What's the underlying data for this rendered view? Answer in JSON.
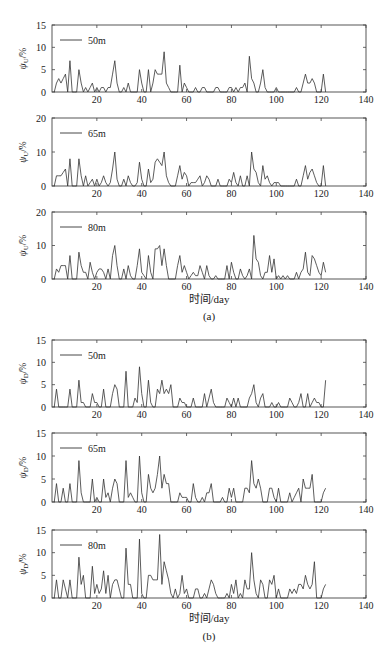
{
  "figure": {
    "caption_a": "(a)",
    "caption_b": "(b)",
    "xlabel": "时间/day"
  },
  "chart_data": [
    {
      "type": "line",
      "group": "a",
      "legend": "50m",
      "ylabel": "ψU/%",
      "ylim": [
        0,
        15
      ],
      "yticks": [
        0,
        5,
        10,
        15
      ],
      "xlim": [
        0,
        140
      ],
      "xticks": [
        20,
        40,
        60,
        80,
        100,
        120,
        140
      ],
      "x_start": 1,
      "values": [
        0,
        2,
        3,
        2,
        3,
        4,
        0,
        7,
        0,
        0,
        0,
        5,
        2,
        0,
        1,
        0,
        1,
        2,
        0,
        1,
        0,
        1,
        1,
        0,
        1,
        1,
        4,
        7,
        2,
        0,
        0,
        1,
        0,
        2,
        0,
        0,
        0,
        0,
        5,
        2,
        0,
        0,
        5,
        0,
        2,
        5,
        4,
        4,
        4,
        9,
        2,
        1,
        0,
        0,
        0,
        0,
        6,
        0,
        2,
        1,
        0,
        0,
        0,
        1,
        0,
        0,
        1,
        1,
        0,
        0,
        0,
        0,
        1,
        1,
        0,
        0,
        0,
        0,
        1,
        1,
        0,
        1,
        0,
        1,
        1,
        2,
        0,
        8,
        3,
        2,
        0,
        0,
        2,
        5,
        1,
        0,
        0,
        0,
        0,
        1,
        0,
        0,
        0,
        0,
        0,
        0,
        0,
        0,
        1,
        0,
        0,
        2,
        4,
        2,
        2,
        3,
        2,
        0,
        0,
        0,
        4,
        0
      ],
      "line_color": "#333333"
    },
    {
      "type": "line",
      "group": "a",
      "legend": "65m",
      "ylabel": "ψU/%",
      "ylim": [
        0,
        20
      ],
      "yticks": [
        0,
        10,
        20
      ],
      "xlim": [
        0,
        140
      ],
      "xticks": [
        20,
        40,
        60,
        80,
        100,
        120,
        140
      ],
      "x_start": 1,
      "values": [
        0,
        3,
        3,
        3,
        4,
        5,
        0,
        8,
        0,
        0,
        0,
        8,
        3,
        0,
        3,
        0,
        1,
        2,
        0,
        2,
        0,
        1,
        3,
        1,
        0,
        1,
        5,
        10,
        2,
        0,
        0,
        2,
        0,
        3,
        1,
        0,
        0,
        1,
        7,
        2,
        0,
        0,
        5,
        1,
        2,
        7,
        8,
        7,
        6,
        10,
        3,
        1,
        0,
        0,
        0,
        3,
        6,
        2,
        4,
        3,
        0,
        1,
        1,
        1,
        2,
        3,
        0,
        1,
        3,
        2,
        0,
        0,
        0,
        2,
        0,
        0,
        0,
        0,
        2,
        1,
        4,
        1,
        0,
        3,
        0,
        0,
        3,
        0,
        10,
        5,
        4,
        1,
        0,
        6,
        2,
        3,
        1,
        0,
        1,
        1,
        1,
        0,
        0,
        0,
        0,
        0,
        0,
        0,
        2,
        0,
        0,
        3,
        6,
        2,
        4,
        5,
        3,
        1,
        0,
        0,
        6,
        0
      ],
      "line_color": "#333333"
    },
    {
      "type": "line",
      "group": "a",
      "legend": "80m",
      "ylabel": "ψU/%",
      "ylim": [
        0,
        20
      ],
      "yticks": [
        0,
        10,
        20
      ],
      "xlim": [
        0,
        140
      ],
      "xticks": [
        20,
        40,
        60,
        80,
        100,
        120,
        140
      ],
      "x_start": 1,
      "values": [
        0,
        3,
        2,
        4,
        4,
        4,
        0,
        7,
        0,
        0,
        0,
        8,
        4,
        2,
        2,
        0,
        5,
        2,
        0,
        2,
        3,
        3,
        2,
        0,
        3,
        0,
        7,
        10,
        4,
        0,
        0,
        3,
        0,
        4,
        1,
        0,
        0,
        4,
        9,
        2,
        1,
        0,
        7,
        2,
        0,
        9,
        9,
        10,
        4,
        9,
        4,
        0,
        0,
        0,
        0,
        4,
        7,
        2,
        4,
        2,
        0,
        1,
        2,
        1,
        1,
        4,
        2,
        0,
        4,
        1,
        0,
        0,
        1,
        0,
        0,
        0,
        0,
        4,
        0,
        5,
        2,
        0,
        0,
        3,
        1,
        0,
        1,
        3,
        0,
        13,
        6,
        5,
        1,
        0,
        2,
        2,
        7,
        2,
        6,
        0,
        1,
        0,
        1,
        0,
        1,
        0,
        0,
        0,
        2,
        0,
        2,
        3,
        8,
        2,
        1,
        7,
        6,
        4,
        2,
        1,
        5,
        2
      ],
      "line_color": "#333333"
    },
    {
      "type": "line",
      "group": "b",
      "legend": "50m",
      "ylabel": "ψD/%",
      "ylim": [
        0,
        15
      ],
      "yticks": [
        0,
        5,
        10,
        15
      ],
      "xlim": [
        0,
        140
      ],
      "xticks": [
        20,
        40,
        60,
        80,
        100,
        120,
        140
      ],
      "x_start": 1,
      "values": [
        0,
        4,
        0,
        0,
        0,
        0,
        0,
        4,
        0,
        0,
        0,
        6,
        1,
        1,
        0,
        0,
        0,
        3,
        1,
        1,
        0,
        0,
        4,
        0,
        0,
        0,
        3,
        5,
        4,
        0,
        0,
        0,
        8,
        0,
        0,
        0,
        2,
        1,
        9,
        3,
        0,
        0,
        6,
        1,
        0,
        0,
        4,
        3,
        6,
        3,
        4,
        3,
        5,
        0,
        0,
        0,
        2,
        1,
        1,
        0,
        0,
        0,
        2,
        0,
        0,
        0,
        0,
        3,
        0,
        2,
        4,
        1,
        0,
        0,
        0,
        0,
        0,
        2,
        1,
        0,
        2,
        0,
        2,
        0,
        0,
        0,
        0,
        2,
        3,
        5,
        1,
        0,
        2,
        3,
        0,
        0,
        0,
        1,
        0,
        0,
        1,
        0,
        0,
        0,
        0,
        2,
        1,
        0,
        0,
        1,
        3,
        0,
        0,
        3,
        0,
        1,
        2,
        1,
        1,
        0,
        0,
        6
      ],
      "line_color": "#333333"
    },
    {
      "type": "line",
      "group": "b",
      "legend": "65m",
      "ylabel": "ψD/%",
      "ylim": [
        0,
        15
      ],
      "yticks": [
        0,
        5,
        10,
        15
      ],
      "xlim": [
        0,
        140
      ],
      "xticks": [
        20,
        40,
        60,
        80,
        100,
        120,
        140
      ],
      "x_start": 1,
      "values": [
        0,
        4,
        0,
        0,
        3,
        0,
        0,
        4,
        0,
        0,
        0,
        9,
        2,
        0,
        0,
        0,
        0,
        5,
        0,
        1,
        0,
        0,
        5,
        1,
        2,
        0,
        3,
        5,
        4,
        0,
        0,
        0,
        9,
        1,
        2,
        1,
        0,
        0,
        10,
        2,
        0,
        0,
        6,
        3,
        2,
        3,
        6,
        10,
        3,
        6,
        4,
        4,
        0,
        0,
        0,
        0,
        2,
        1,
        1,
        1,
        0,
        0,
        4,
        1,
        0,
        0,
        1,
        0,
        2,
        2,
        4,
        0,
        0,
        0,
        0,
        1,
        0,
        0,
        3,
        1,
        3,
        0,
        0,
        0,
        0,
        3,
        3,
        2,
        9,
        4,
        3,
        5,
        3,
        0,
        0,
        0,
        3,
        3,
        1,
        0,
        3,
        0,
        0,
        0,
        0,
        2,
        0,
        1,
        2,
        3,
        0,
        5,
        3,
        3,
        3,
        6,
        0,
        0,
        0,
        0,
        2,
        3
      ],
      "line_color": "#333333"
    },
    {
      "type": "line",
      "group": "b",
      "legend": "80m",
      "ylabel": "ψD/%",
      "ylim": [
        0,
        15
      ],
      "yticks": [
        0,
        5,
        10,
        15
      ],
      "xlim": [
        0,
        140
      ],
      "xticks": [
        20,
        40,
        60,
        80,
        100,
        120,
        140
      ],
      "x_start": 1,
      "values": [
        0,
        4,
        0,
        0,
        4,
        2,
        0,
        4,
        0,
        0,
        0,
        9,
        3,
        5,
        0,
        0,
        0,
        7,
        1,
        3,
        1,
        2,
        6,
        1,
        5,
        0,
        3,
        4,
        4,
        2,
        0,
        0,
        11,
        3,
        3,
        0,
        0,
        0,
        13,
        1,
        0,
        0,
        5,
        5,
        4,
        4,
        4,
        14,
        3,
        8,
        6,
        4,
        1,
        0,
        2,
        0,
        1,
        5,
        1,
        2,
        0,
        0,
        0,
        2,
        2,
        0,
        0,
        1,
        0,
        2,
        4,
        3,
        1,
        0,
        0,
        0,
        0,
        1,
        0,
        3,
        1,
        4,
        0,
        1,
        0,
        4,
        2,
        2,
        10,
        4,
        1,
        0,
        4,
        3,
        0,
        0,
        4,
        3,
        5,
        0,
        2,
        0,
        0,
        0,
        0,
        2,
        1,
        2,
        1,
        3,
        3,
        2,
        5,
        3,
        2,
        3,
        8,
        0,
        0,
        0,
        2,
        3
      ],
      "line_color": "#333333"
    }
  ]
}
